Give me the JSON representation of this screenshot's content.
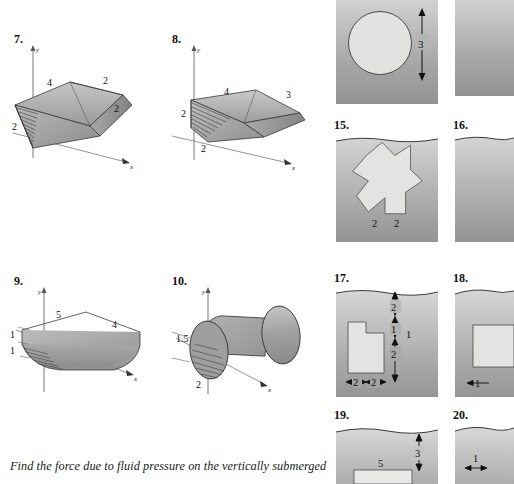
{
  "page": {
    "width": 514,
    "height": 484,
    "background": "#ffffff",
    "text_color": "#000000"
  },
  "caption": {
    "line1": "Find the force due to fluid pressure on the vertically submerged"
  },
  "left_column": {
    "label": "Three-dimensional tank figures",
    "figures": [
      {
        "number": "7.",
        "type": "trapezoidal-trough",
        "axis_labels": {
          "y": "y",
          "x": "x"
        },
        "dimensions": [
          {
            "value": "4",
            "position": "top-left-edge"
          },
          {
            "value": "2",
            "position": "top-right-edge"
          },
          {
            "value": "2",
            "position": "right-side"
          },
          {
            "value": "2",
            "position": "left-depth"
          }
        ]
      },
      {
        "number": "8.",
        "type": "trapezoidal-trough",
        "axis_labels": {
          "y": "y",
          "x": "x"
        },
        "dimensions": [
          {
            "value": "4",
            "position": "top-left-edge"
          },
          {
            "value": "3",
            "position": "top-right-edge"
          },
          {
            "value": "2",
            "position": "left-depth"
          },
          {
            "value": "2",
            "position": "bottom-front"
          }
        ]
      },
      {
        "number": "9.",
        "type": "rounded-rectangular-tank",
        "axis_labels": {
          "y": "y",
          "x": "x"
        },
        "dimensions": [
          {
            "value": "5",
            "position": "top-left-edge"
          },
          {
            "value": "4",
            "position": "top-right-edge"
          },
          {
            "value": "1",
            "position": "upper-left-depth"
          },
          {
            "value": "1",
            "position": "lower-left-depth"
          }
        ]
      },
      {
        "number": "10.",
        "type": "horizontal-cylinder",
        "axis_labels": {
          "y": "y",
          "x": "x"
        },
        "dimensions": [
          {
            "value": "1.5",
            "position": "radius-upper-left"
          },
          {
            "value": "2",
            "position": "lower-left"
          }
        ]
      }
    ]
  },
  "right_column": {
    "label": "Submerged plate figures",
    "panels": [
      {
        "number": "",
        "shape": "circle",
        "clipped": "top",
        "dimensions": [
          {
            "value": "3",
            "orientation": "vertical"
          }
        ]
      },
      {
        "number": "",
        "shape": "rectangle",
        "clipped": "top-right",
        "dimensions": []
      },
      {
        "number": "15.",
        "shape": "cross",
        "dimensions": [
          {
            "value": "2",
            "orientation": "horizontal"
          },
          {
            "value": "2",
            "orientation": "horizontal"
          }
        ]
      },
      {
        "number": "16.",
        "shape": "blank",
        "clipped": "right",
        "dimensions": []
      },
      {
        "number": "17.",
        "shape": "L-shape",
        "dimensions": [
          {
            "value": "2",
            "orientation": "vertical"
          },
          {
            "value": "1",
            "orientation": "vertical"
          },
          {
            "value": "2",
            "orientation": "vertical"
          },
          {
            "value": "1",
            "orientation": "vertical-total"
          },
          {
            "value": "2",
            "orientation": "horizontal"
          },
          {
            "value": "2",
            "orientation": "horizontal"
          }
        ]
      },
      {
        "number": "18.",
        "shape": "rectangle",
        "clipped": "right",
        "dimensions": [
          {
            "value": "1",
            "orientation": "horizontal"
          }
        ]
      },
      {
        "number": "19.",
        "shape": "rectangle",
        "clipped": "bottom",
        "dimensions": [
          {
            "value": "5",
            "orientation": "horizontal"
          },
          {
            "value": "3",
            "orientation": "vertical"
          }
        ]
      },
      {
        "number": "20.",
        "shape": "rectangle",
        "clipped": "bottom-right",
        "dimensions": [
          {
            "value": "1",
            "orientation": "horizontal"
          }
        ]
      }
    ]
  },
  "colors": {
    "water_top": "#d2d2d2",
    "water_bottom": "#939393",
    "plate_fill": "#e2e2e0",
    "plate_stroke": "#4a4a4a",
    "solid_fill_light": "#b8b8b8",
    "solid_fill_dark": "#8e8e8e",
    "axis_line": "#6b6b6b"
  }
}
